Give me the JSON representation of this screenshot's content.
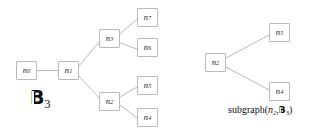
{
  "figure": {
    "background_color": "#ffffff",
    "edge_color": "#b0b0b0",
    "node_border_color": "#b9b9b9",
    "node_fill_color": "#ffffff",
    "text_color": "#1b1b1b"
  },
  "left_graph": {
    "name": "B_3",
    "label_base": "B",
    "label_subscript": "3",
    "nodes": [
      {
        "id": "n0",
        "base": "n",
        "subscript": "0",
        "x": 16,
        "y": 61,
        "w": 21,
        "h": 19
      },
      {
        "id": "n1",
        "base": "n",
        "subscript": "1",
        "x": 58,
        "y": 61,
        "w": 21,
        "h": 19
      },
      {
        "id": "n3",
        "base": "n",
        "subscript": "3",
        "x": 99,
        "y": 29,
        "w": 21,
        "h": 19
      },
      {
        "id": "n7",
        "base": "n",
        "subscript": "7",
        "x": 137,
        "y": 8,
        "w": 21,
        "h": 19
      },
      {
        "id": "n6",
        "base": "n",
        "subscript": "6",
        "x": 137,
        "y": 38,
        "w": 21,
        "h": 19
      },
      {
        "id": "n2",
        "base": "n",
        "subscript": "2",
        "x": 99,
        "y": 92,
        "w": 21,
        "h": 19
      },
      {
        "id": "n5",
        "base": "n",
        "subscript": "5",
        "x": 137,
        "y": 76,
        "w": 21,
        "h": 19
      },
      {
        "id": "n4",
        "base": "n",
        "subscript": "4",
        "x": 137,
        "y": 108,
        "w": 21,
        "h": 19
      }
    ],
    "edges": [
      {
        "from": "n0",
        "to": "n1",
        "x1": 37,
        "y1": 70.5,
        "x2": 58,
        "y2": 70.5
      },
      {
        "from": "n1",
        "to": "n3",
        "x1": 79,
        "y1": 66,
        "x2": 99,
        "y2": 42
      },
      {
        "from": "n1",
        "to": "n2",
        "x1": 79,
        "y1": 76,
        "x2": 99,
        "y2": 98
      },
      {
        "from": "n3",
        "to": "n7",
        "x1": 120,
        "y1": 34,
        "x2": 137,
        "y2": 19
      },
      {
        "from": "n3",
        "to": "n6",
        "x1": 120,
        "y1": 43,
        "x2": 137,
        "y2": 49
      },
      {
        "from": "n2",
        "to": "n5",
        "x1": 120,
        "y1": 97,
        "x2": 137,
        "y2": 87
      },
      {
        "from": "n2",
        "to": "n4",
        "x1": 120,
        "y1": 105,
        "x2": 137,
        "y2": 118
      }
    ],
    "label_x": 30,
    "label_y": 88
  },
  "right_graph": {
    "caption_prefix": "subgraph(",
    "caption_arg1_base": "n",
    "caption_arg1_subscript": "2",
    "caption_separator": ",",
    "caption_arg2_base": "B",
    "caption_arg2_subscript": "3",
    "caption_suffix": ")",
    "nodes": [
      {
        "id": "n2",
        "base": "n",
        "subscript": "2",
        "x": 205,
        "y": 53,
        "w": 21,
        "h": 19
      },
      {
        "id": "n5",
        "base": "n",
        "subscript": "5",
        "x": 269,
        "y": 23,
        "w": 21,
        "h": 19
      },
      {
        "id": "n4",
        "base": "n",
        "subscript": "4",
        "x": 269,
        "y": 82,
        "w": 21,
        "h": 19
      }
    ],
    "edges": [
      {
        "from": "n2",
        "to": "n5",
        "x1": 226,
        "y1": 58,
        "x2": 269,
        "y2": 35
      },
      {
        "from": "n2",
        "to": "n4",
        "x1": 226,
        "y1": 67,
        "x2": 269,
        "y2": 90
      }
    ],
    "caption_x": 228,
    "caption_y": 105
  }
}
